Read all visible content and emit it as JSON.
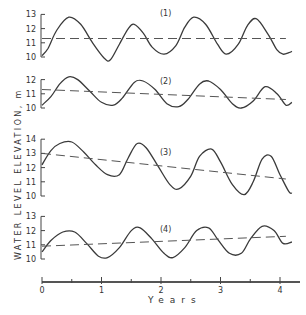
{
  "chart_data": {
    "type": "line",
    "title": "",
    "xlabel": "Years",
    "ylabel": "WATER LEVEL ELEVATION, m",
    "xlim": [
      0,
      4.25
    ],
    "x_ticks": [
      0,
      0.5,
      1,
      1.5,
      2,
      2.5,
      3,
      3.5,
      4
    ],
    "x_tick_labels": [
      "0",
      "1",
      "2",
      "3",
      "4"
    ],
    "grid": false,
    "panels": [
      {
        "label": "(1)",
        "ylim": [
          10,
          13
        ],
        "y_tick_labels": [
          "10",
          "11",
          "12",
          "13"
        ],
        "series": [
          {
            "name": "water level",
            "style": "solid",
            "x": [
              0,
              0.1,
              0.25,
              0.45,
              0.65,
              0.85,
              1.05,
              1.15,
              1.3,
              1.45,
              1.55,
              1.7,
              1.85,
              2.05,
              2.25,
              2.4,
              2.55,
              2.75,
              2.95,
              3.1,
              3.3,
              3.45,
              3.6,
              3.8,
              3.95,
              4.05,
              4.15,
              4.2
            ],
            "y": [
              10.1,
              10.6,
              11.9,
              12.8,
              12.3,
              11.0,
              9.9,
              9.8,
              10.9,
              12.0,
              12.3,
              11.7,
              10.7,
              10.2,
              10.8,
              12.1,
              12.8,
              12.3,
              10.9,
              10.2,
              10.9,
              12.2,
              12.7,
              11.6,
              10.5,
              10.2,
              10.3,
              10.4
            ]
          },
          {
            "name": "trend",
            "style": "dashed",
            "x": [
              0,
              4.1
            ],
            "y": [
              11.3,
              11.3
            ]
          }
        ]
      },
      {
        "label": "(2)",
        "ylim": [
          10,
          12
        ],
        "y_tick_labels": [
          "10",
          "11",
          "12"
        ],
        "series": [
          {
            "name": "water level",
            "style": "solid",
            "x": [
              0,
              0.15,
              0.3,
              0.45,
              0.6,
              0.8,
              1.0,
              1.2,
              1.35,
              1.55,
              1.7,
              1.9,
              2.1,
              2.3,
              2.45,
              2.65,
              2.8,
              3.0,
              3.2,
              3.35,
              3.55,
              3.75,
              3.95,
              4.1,
              4.2
            ],
            "y": [
              10.2,
              10.8,
              11.7,
              12.2,
              12.0,
              11.2,
              10.4,
              10.2,
              10.7,
              11.8,
              11.9,
              11.3,
              10.3,
              10.1,
              10.6,
              11.7,
              11.9,
              11.3,
              10.3,
              10.0,
              10.5,
              11.5,
              11.0,
              10.2,
              10.4
            ]
          },
          {
            "name": "trend",
            "style": "dashed",
            "x": [
              0,
              4.1
            ],
            "y": [
              11.3,
              10.6
            ]
          }
        ]
      },
      {
        "label": "(3)",
        "ylim": [
          10,
          14
        ],
        "y_tick_labels": [
          "10",
          "11",
          "12",
          "13",
          "14"
        ],
        "series": [
          {
            "name": "water level",
            "style": "solid",
            "x": [
              0,
              0.15,
              0.3,
              0.5,
              0.7,
              0.9,
              1.1,
              1.3,
              1.45,
              1.6,
              1.75,
              1.95,
              2.15,
              2.3,
              2.5,
              2.65,
              2.85,
              3.0,
              3.2,
              3.4,
              3.55,
              3.7,
              3.85,
              4.0,
              4.15,
              4.2
            ],
            "y": [
              12.2,
              13.2,
              13.7,
              13.8,
              13.1,
              12.2,
              11.5,
              11.5,
              12.7,
              13.7,
              13.4,
              12.1,
              10.8,
              10.5,
              11.4,
              12.8,
              13.3,
              12.4,
              10.8,
              10.1,
              11.0,
              12.6,
              12.8,
              11.5,
              10.3,
              10.2
            ]
          },
          {
            "name": "trend",
            "style": "dashed",
            "x": [
              0,
              4.1
            ],
            "y": [
              13.0,
              11.2
            ]
          }
        ]
      },
      {
        "label": "(4)",
        "ylim": [
          10,
          13
        ],
        "y_tick_labels": [
          "10",
          "11",
          "12",
          "13"
        ],
        "series": [
          {
            "name": "water level",
            "style": "solid",
            "x": [
              0,
              0.15,
              0.35,
              0.55,
              0.75,
              0.95,
              1.1,
              1.3,
              1.5,
              1.65,
              1.85,
              2.05,
              2.2,
              2.4,
              2.6,
              2.8,
              2.95,
              3.15,
              3.35,
              3.5,
              3.7,
              3.9,
              4.05,
              4.2
            ],
            "y": [
              10.5,
              11.3,
              11.9,
              11.9,
              11.1,
              10.2,
              10.1,
              10.8,
              12.0,
              12.2,
              11.4,
              10.4,
              10.1,
              10.8,
              12.0,
              12.2,
              11.4,
              10.4,
              10.4,
              11.4,
              12.3,
              12.0,
              11.1,
              11.2
            ]
          },
          {
            "name": "trend",
            "style": "dashed",
            "x": [
              0,
              4.1
            ],
            "y": [
              10.9,
              11.6
            ]
          }
        ]
      }
    ]
  }
}
